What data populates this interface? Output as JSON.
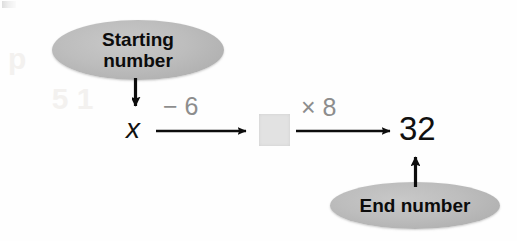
{
  "figure": {
    "type": "function-machine-flow-diagram",
    "background_color": "#fefefe",
    "bubble_fill_color": "#bdbdbd",
    "operation_label_color": "#8d8d8d",
    "blank_box_color": "#e2e2e2",
    "ink_color": "#101010",
    "callouts": {
      "start": {
        "label": "Starting\nnumber",
        "line1": "Starting",
        "line2": "number",
        "points_to": "x"
      },
      "end": {
        "label": "End number",
        "points_to": "32"
      }
    },
    "flow": {
      "start_value": "x",
      "end_value": "32",
      "blank_value": "",
      "steps": [
        {
          "operator": "− 6",
          "label": "− 6",
          "from": "x",
          "to": "blank"
        },
        {
          "operator": "× 8",
          "label": "× 8",
          "from": "blank",
          "to": "32"
        }
      ]
    },
    "ghost_text": {
      "top": "ghost bleed-through",
      "mid": "ghost bleed-through"
    }
  }
}
